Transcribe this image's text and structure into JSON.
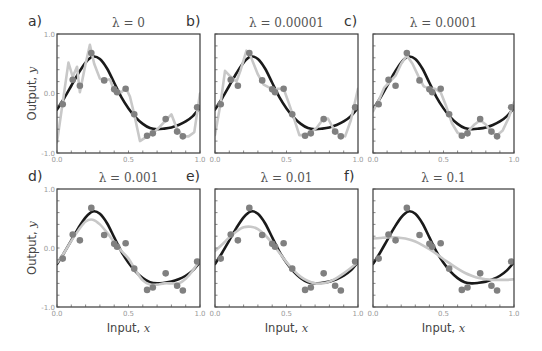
{
  "chart_data": {
    "type": "line",
    "layout": {
      "rows": 2,
      "cols": 3,
      "grid": false,
      "legend": "none"
    },
    "shared": {
      "xlabel": "Input, ",
      "xlabel_var": "x",
      "ylabel": "Output, ",
      "ylabel_var": "y",
      "xlim": [
        0.0,
        1.0
      ],
      "ylim": [
        -1.0,
        1.0
      ],
      "xticks": [
        0.0,
        0.5,
        1.0
      ],
      "xtick_labels": [
        "0.0",
        "0.5",
        "1.0"
      ],
      "yticks": [
        -1.0,
        0.0,
        1.0
      ],
      "ytick_labels": [
        "-1.0",
        "0.0",
        "1.0"
      ],
      "minor_tick_step": 0.1
    },
    "series_styles": {
      "true_function": {
        "color": "#1a1a1a",
        "description": "true underlying function (black)"
      },
      "fitted_model": {
        "color": "#c8c8c8",
        "description": "fitted model (light gray)"
      },
      "training_data": {
        "color": "#808080",
        "description": "noisy training points"
      }
    },
    "training_data": {
      "x": [
        0.04,
        0.11,
        0.16,
        0.24,
        0.33,
        0.4,
        0.42,
        0.48,
        0.54,
        0.63,
        0.67,
        0.76,
        0.84,
        0.88,
        0.98
      ],
      "y": [
        -0.18,
        0.23,
        0.13,
        0.68,
        0.22,
        0.07,
        0.02,
        0.08,
        -0.35,
        -0.71,
        -0.67,
        -0.43,
        -0.64,
        -0.72,
        -0.23
      ]
    },
    "true_function": {
      "x": [
        0.0,
        0.05,
        0.1,
        0.15,
        0.2,
        0.25,
        0.3,
        0.35,
        0.4,
        0.45,
        0.5,
        0.55,
        0.6,
        0.65,
        0.7,
        0.75,
        0.8,
        0.85,
        0.9,
        0.95,
        1.0
      ],
      "y": [
        -0.27,
        -0.08,
        0.13,
        0.34,
        0.52,
        0.62,
        0.58,
        0.42,
        0.18,
        -0.06,
        -0.25,
        -0.4,
        -0.51,
        -0.58,
        -0.6,
        -0.59,
        -0.57,
        -0.53,
        -0.47,
        -0.38,
        -0.24
      ]
    },
    "panels": [
      {
        "letter": "a)",
        "title": "λ = 0",
        "lambda": 0,
        "show_ylabel": true,
        "show_xlabel": false,
        "show_yticklabels": true,
        "fit": {
          "x": [
            0.0,
            0.04,
            0.08,
            0.11,
            0.14,
            0.16,
            0.2,
            0.23,
            0.26,
            0.3,
            0.33,
            0.37,
            0.4,
            0.42,
            0.45,
            0.48,
            0.51,
            0.54,
            0.58,
            0.63,
            0.67,
            0.71,
            0.76,
            0.8,
            0.84,
            0.88,
            0.92,
            0.96,
            1.0
          ],
          "y": [
            -0.82,
            -0.15,
            0.52,
            0.28,
            0.45,
            0.02,
            0.5,
            0.82,
            0.5,
            0.25,
            0.22,
            0.24,
            0.05,
            0.05,
            0.02,
            0.1,
            -0.05,
            -0.35,
            -0.8,
            -0.72,
            -0.67,
            -0.58,
            -0.45,
            -0.35,
            -0.6,
            -0.72,
            -0.72,
            -0.65,
            0.0
          ]
        }
      },
      {
        "letter": "b)",
        "title": "λ = 0.00001",
        "lambda": 1e-05,
        "show_ylabel": false,
        "show_xlabel": false,
        "show_yticklabels": false,
        "fit": {
          "x": [
            0.0,
            0.04,
            0.07,
            0.11,
            0.15,
            0.18,
            0.22,
            0.25,
            0.3,
            0.34,
            0.38,
            0.41,
            0.44,
            0.48,
            0.51,
            0.55,
            0.59,
            0.63,
            0.67,
            0.71,
            0.75,
            0.79,
            0.83,
            0.87,
            0.91,
            0.95,
            1.0
          ],
          "y": [
            -0.7,
            -0.15,
            0.38,
            0.28,
            0.2,
            0.4,
            0.72,
            0.62,
            0.32,
            0.15,
            0.1,
            0.05,
            0.08,
            0.08,
            -0.12,
            -0.4,
            -0.7,
            -0.7,
            -0.65,
            -0.58,
            -0.45,
            -0.42,
            -0.6,
            -0.7,
            -0.72,
            -0.45,
            0.08
          ]
        }
      },
      {
        "letter": "c)",
        "title": "λ = 0.0001",
        "lambda": 0.0001,
        "show_ylabel": false,
        "show_xlabel": false,
        "show_yticklabels": false,
        "fit": {
          "x": [
            0.0,
            0.04,
            0.08,
            0.12,
            0.16,
            0.2,
            0.24,
            0.28,
            0.32,
            0.36,
            0.4,
            0.44,
            0.48,
            0.52,
            0.56,
            0.6,
            0.64,
            0.68,
            0.72,
            0.76,
            0.8,
            0.84,
            0.88,
            0.92,
            0.96,
            1.0
          ],
          "y": [
            -0.3,
            -0.12,
            0.1,
            0.2,
            0.3,
            0.5,
            0.64,
            0.5,
            0.3,
            0.12,
            0.08,
            0.08,
            0.02,
            -0.22,
            -0.5,
            -0.66,
            -0.7,
            -0.62,
            -0.52,
            -0.45,
            -0.52,
            -0.65,
            -0.7,
            -0.62,
            -0.42,
            -0.15
          ]
        }
      },
      {
        "letter": "d)",
        "title": "λ = 0.001",
        "lambda": 0.001,
        "show_ylabel": true,
        "show_xlabel": true,
        "show_yticklabels": true,
        "fit": {
          "x": [
            0.0,
            0.05,
            0.1,
            0.15,
            0.2,
            0.25,
            0.3,
            0.35,
            0.4,
            0.45,
            0.5,
            0.55,
            0.6,
            0.65,
            0.7,
            0.75,
            0.8,
            0.85,
            0.9,
            0.95,
            1.0
          ],
          "y": [
            -0.25,
            -0.08,
            0.12,
            0.3,
            0.45,
            0.48,
            0.4,
            0.26,
            0.1,
            -0.05,
            -0.18,
            -0.38,
            -0.55,
            -0.62,
            -0.62,
            -0.6,
            -0.6,
            -0.6,
            -0.52,
            -0.38,
            -0.2
          ]
        }
      },
      {
        "letter": "e)",
        "title": "λ = 0.01",
        "lambda": 0.01,
        "show_ylabel": false,
        "show_xlabel": true,
        "show_yticklabels": false,
        "fit": {
          "x": [
            0.0,
            0.05,
            0.1,
            0.15,
            0.2,
            0.25,
            0.3,
            0.35,
            0.4,
            0.45,
            0.5,
            0.55,
            0.6,
            0.65,
            0.7,
            0.75,
            0.8,
            0.85,
            0.9,
            0.95,
            1.0
          ],
          "y": [
            -0.05,
            0.06,
            0.18,
            0.28,
            0.35,
            0.36,
            0.32,
            0.22,
            0.08,
            -0.08,
            -0.24,
            -0.38,
            -0.49,
            -0.56,
            -0.6,
            -0.6,
            -0.57,
            -0.51,
            -0.43,
            -0.34,
            -0.24
          ]
        }
      },
      {
        "letter": "f)",
        "title": "λ = 0.1",
        "lambda": 0.1,
        "show_ylabel": false,
        "show_xlabel": true,
        "show_yticklabels": false,
        "fit": {
          "x": [
            0.0,
            0.05,
            0.1,
            0.15,
            0.2,
            0.25,
            0.3,
            0.35,
            0.4,
            0.45,
            0.5,
            0.55,
            0.6,
            0.65,
            0.7,
            0.75,
            0.8,
            0.85,
            0.9,
            0.95,
            1.0
          ],
          "y": [
            0.16,
            0.17,
            0.18,
            0.18,
            0.17,
            0.15,
            0.11,
            0.05,
            -0.02,
            -0.1,
            -0.19,
            -0.27,
            -0.35,
            -0.42,
            -0.47,
            -0.51,
            -0.53,
            -0.54,
            -0.54,
            -0.54,
            -0.53
          ]
        }
      }
    ]
  }
}
